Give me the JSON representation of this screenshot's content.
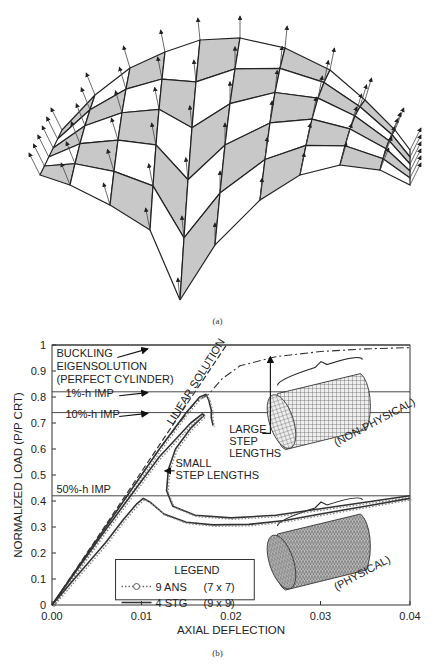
{
  "captions": {
    "a": "(a)",
    "b": "(b)"
  },
  "mesh": {
    "description": "Shell surface mesh with normal vectors",
    "rows": 5,
    "cols": 9,
    "fill_shaded": "#c8c8c8",
    "fill_plain": "#ffffff",
    "stroke": "#222222"
  },
  "chart_data": {
    "type": "line",
    "title": "",
    "xlabel": "AXIAL DEFLECTION",
    "ylabel": "NORMALIZED LOAD (P/P CRT)",
    "xlim": [
      0.0,
      0.04
    ],
    "ylim": [
      0.0,
      1.0
    ],
    "x_ticks": [
      "0.00",
      "0.01",
      "0.02",
      "0.03",
      "0.04"
    ],
    "y_ticks": [
      "0",
      "0.1",
      "0.2",
      "0.3",
      "0.4",
      "0.5",
      "0.6",
      "0.7",
      "0.8",
      "0.9",
      "1"
    ],
    "grid": false,
    "hlines": [
      {
        "y": 1.0,
        "label": ""
      },
      {
        "y": 0.82,
        "label": "1%-h IMP"
      },
      {
        "y": 0.74,
        "label": "10%-h IMP"
      },
      {
        "y": 0.42,
        "label": "50%-h IMP"
      }
    ],
    "annotations": [
      {
        "text": "BUCKLING",
        "x": 0.0005,
        "y": 0.955
      },
      {
        "text": "EIGENSOLUTION",
        "x": 0.0005,
        "y": 0.905
      },
      {
        "text": "(PERFECT CYLINDER)",
        "x": 0.0005,
        "y": 0.855
      },
      {
        "text": "1%-h IMP",
        "x": 0.0015,
        "y": 0.8
      },
      {
        "text": "10%-h IMP",
        "x": 0.0015,
        "y": 0.72
      },
      {
        "text": "50%-h IMP",
        "x": 0.0005,
        "y": 0.43
      },
      {
        "text": "LINEAR SOLUTION",
        "x": 0.0135,
        "y": 0.69,
        "rotate": -58
      },
      {
        "text": "LARGE",
        "x": 0.0198,
        "y": 0.66
      },
      {
        "text": "STEP",
        "x": 0.0198,
        "y": 0.615
      },
      {
        "text": "LENGTHS",
        "x": 0.0198,
        "y": 0.57
      },
      {
        "text": "SMALL",
        "x": 0.0138,
        "y": 0.53
      },
      {
        "text": "STEP LENGTHS",
        "x": 0.0138,
        "y": 0.485
      },
      {
        "text": "(NON-PHYSICAL)",
        "x": 0.0318,
        "y": 0.61,
        "rotate": -28
      },
      {
        "text": "(PHYSICAL)",
        "x": 0.0318,
        "y": 0.055,
        "rotate": -28
      }
    ],
    "legend": {
      "title": "LEGEND",
      "position": "lower-center",
      "entries": [
        {
          "marker": "··○··",
          "name": "9 ANS",
          "mesh": "(7 x 7)",
          "style": "dotted-circle"
        },
        {
          "marker": "———",
          "name": "4 STG",
          "mesh": "(9 x 9)",
          "style": "solid"
        }
      ]
    },
    "series": [
      {
        "name": "LINEAR SOLUTION",
        "style": "dash",
        "x": [
          0.0,
          0.0195
        ],
        "y": [
          0.0,
          1.0
        ]
      },
      {
        "name": "1%-h IMP large step",
        "style": "dashdot",
        "x": [
          0.0,
          0.006,
          0.012,
          0.016,
          0.0175,
          0.018,
          0.019,
          0.021,
          0.025,
          0.03,
          0.035,
          0.04
        ],
        "y": [
          0.0,
          0.3,
          0.6,
          0.78,
          0.81,
          0.83,
          0.87,
          0.92,
          0.955,
          0.975,
          0.985,
          0.99
        ]
      },
      {
        "name": "1%-h IMP",
        "style": "solid-dotted",
        "x": [
          0.0,
          0.006,
          0.012,
          0.015,
          0.0165,
          0.0172,
          0.0175,
          0.0178,
          0.0178,
          0.018
        ],
        "y": [
          0.0,
          0.3,
          0.6,
          0.74,
          0.8,
          0.81,
          0.79,
          0.75,
          0.72,
          0.69
        ]
      },
      {
        "name": "10%-h IMP small step",
        "style": "solid-dotted",
        "x": [
          0.0,
          0.006,
          0.012,
          0.0155,
          0.0168,
          0.017,
          0.0155,
          0.0138,
          0.013,
          0.0128,
          0.0135,
          0.016,
          0.02,
          0.025,
          0.03,
          0.035,
          0.04
        ],
        "y": [
          0.0,
          0.29,
          0.57,
          0.7,
          0.735,
          0.73,
          0.68,
          0.6,
          0.52,
          0.44,
          0.38,
          0.345,
          0.335,
          0.345,
          0.37,
          0.395,
          0.42
        ]
      },
      {
        "name": "50%-h IMP",
        "style": "solid-dotted",
        "x": [
          0.0,
          0.003,
          0.006,
          0.008,
          0.0095,
          0.0102,
          0.011,
          0.0125,
          0.015,
          0.018,
          0.022,
          0.026,
          0.03,
          0.035,
          0.04
        ],
        "y": [
          0.0,
          0.12,
          0.24,
          0.33,
          0.39,
          0.41,
          0.395,
          0.35,
          0.318,
          0.308,
          0.31,
          0.325,
          0.35,
          0.38,
          0.41
        ]
      }
    ],
    "insets": [
      {
        "name": "non-physical-cylinder",
        "label": "(NON-PHYSICAL)",
        "cx": 0.0305,
        "cy": 0.74,
        "pattern": "grid"
      },
      {
        "name": "physical-cylinder",
        "label": "(PHYSICAL)",
        "cx": 0.0305,
        "cy": 0.2,
        "pattern": "wrinkled"
      }
    ]
  }
}
